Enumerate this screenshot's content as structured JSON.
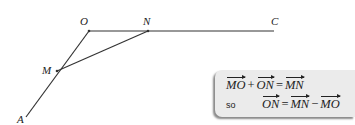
{
  "diagram": {
    "points": {
      "O": {
        "label": "O"
      },
      "N": {
        "label": "N"
      },
      "C": {
        "label": "C"
      },
      "M": {
        "label": "M"
      },
      "A": {
        "label": "A"
      }
    },
    "segments": [
      "OC",
      "OA",
      "MN"
    ]
  },
  "equation_box": {
    "line1": {
      "t1": "MO",
      "op1": "+",
      "t2": "ON",
      "eq": "=",
      "t3": "MN"
    },
    "line2": {
      "prefix": "so",
      "t1": "ON",
      "eq": "=",
      "t2": "MN",
      "op1": "−",
      "t3": "MO"
    }
  }
}
